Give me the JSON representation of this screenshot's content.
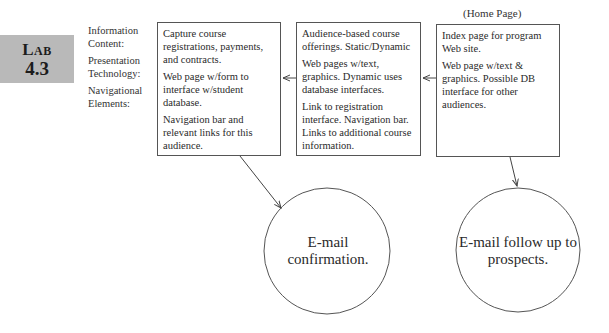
{
  "badge": {
    "word_first": "L",
    "word_rest": "AB",
    "number": "4.3"
  },
  "legend": {
    "items": [
      {
        "label": "Information Content:"
      },
      {
        "label": "Presentation Technology:"
      },
      {
        "label": "Navigational Elements:"
      }
    ]
  },
  "home_label": "(Home Page)",
  "boxes": [
    {
      "id": "registration",
      "information_content": "Capture course registrations, payments, and contracts.",
      "presentation_technology": "Web page w/form to interface w/student database.",
      "navigational_elements": "Navigation bar and relevant links for this audience."
    },
    {
      "id": "course-offerings",
      "information_content": "Audience-based course offerings. Static/Dynamic",
      "presentation_technology": "Web pages w/text, graphics. Dynamic uses database interfaces.",
      "navigational_elements": "Link to registration interface. Navigation bar. Links to additional course information."
    },
    {
      "id": "home-page",
      "information_content": "Index page for program Web site.",
      "presentation_technology": "Web page w/text & graphics. Possible DB interface for other audiences.",
      "navigational_elements": ""
    }
  ],
  "circles": [
    {
      "id": "email-confirmation",
      "label": "E-mail confirmation."
    },
    {
      "id": "email-follow-up",
      "label": "E-mail follow up to prospects."
    }
  ],
  "colors": {
    "badge_bg": "#b9b9b9",
    "stroke": "#555555",
    "text": "#2a2a2a"
  }
}
